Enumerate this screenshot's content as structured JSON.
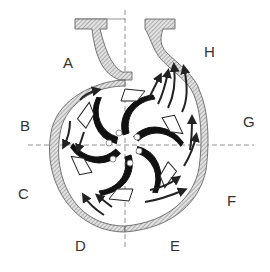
{
  "diagram": {
    "labels": [
      {
        "id": "A",
        "text": "A",
        "x": 63,
        "y": 55
      },
      {
        "id": "B",
        "text": "B",
        "x": 20,
        "y": 118
      },
      {
        "id": "C",
        "text": "C",
        "x": 18,
        "y": 186
      },
      {
        "id": "D",
        "text": "D",
        "x": 75,
        "y": 238
      },
      {
        "id": "E",
        "text": "E",
        "x": 170,
        "y": 238
      },
      {
        "id": "F",
        "text": "F",
        "x": 227,
        "y": 193
      },
      {
        "id": "G",
        "text": "G",
        "x": 243,
        "y": 114
      },
      {
        "id": "H",
        "text": "H",
        "x": 204,
        "y": 44
      }
    ],
    "colors": {
      "casing_fill": "#b0b0b0",
      "line": "#222222",
      "centerline": "#777777",
      "background": "#ffffff"
    },
    "impeller": {
      "blades": 6,
      "holes": 6
    },
    "flow_arrows": "increasing-spiral"
  }
}
